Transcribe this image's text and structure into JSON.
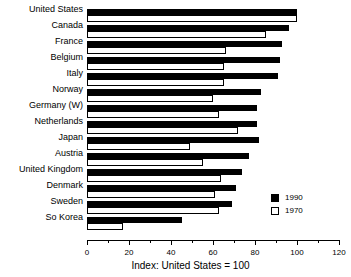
{
  "chart_data": {
    "type": "bar",
    "orientation": "horizontal",
    "title": "",
    "xlabel": "Index: United States = 100",
    "ylabel": "",
    "xlim": [
      0,
      120
    ],
    "xticks": [
      0,
      20,
      40,
      60,
      80,
      100,
      120
    ],
    "xtick_labels": [
      "0",
      "20",
      "40",
      "60",
      "80",
      "100",
      "120"
    ],
    "minor_tick_step": 10,
    "grid": false,
    "legend_position": "center-right",
    "categories": [
      "United States",
      "Canada",
      "France",
      "Belgium",
      "Italy",
      "Norway",
      "Germany (W)",
      "Netherlands",
      "Japan",
      "Austria",
      "United Kingdom",
      "Denmark",
      "Sweden",
      "So Korea"
    ],
    "series": [
      {
        "name": "1990",
        "color": "#000000",
        "values": [
          100,
          96,
          93,
          92,
          91,
          83,
          81,
          81,
          82,
          77,
          74,
          71,
          69,
          45
        ]
      },
      {
        "name": "1970",
        "color": "#ffffff",
        "values": [
          100,
          85,
          66,
          65,
          65,
          60,
          63,
          72,
          49,
          55,
          64,
          61,
          63,
          17
        ]
      }
    ]
  },
  "legend": {
    "items": [
      {
        "label": "1990",
        "style": "filled"
      },
      {
        "label": "1970",
        "style": "hollow"
      }
    ]
  }
}
